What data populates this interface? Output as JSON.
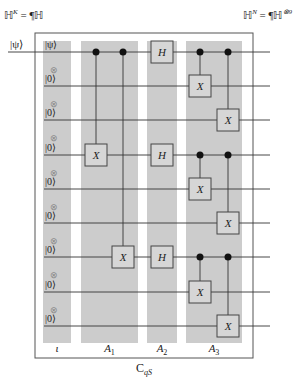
{
  "header": {
    "left": {
      "base": "ℍ",
      "sup": "K",
      "rhs": "= ¶ℍ"
    },
    "right": {
      "base": "ℍ",
      "sup": "N",
      "rhs": "= ¶ℍ",
      "rhs_sup": "⊗9"
    }
  },
  "input_label": "|ψ⟩",
  "register": {
    "labels": [
      "|ψ⟩",
      "|0⟩",
      "|0⟩",
      "|0⟩",
      "|0⟩",
      "|0⟩",
      "|0⟩",
      "|0⟩",
      "|0⟩"
    ],
    "tensor_symbol": "⊗"
  },
  "wires_y": [
    52,
    86,
    120,
    155,
    189,
    223,
    257,
    292,
    326
  ],
  "columns": [
    {
      "name": "iota",
      "label": "ι",
      "x0": 43,
      "x1": 71
    },
    {
      "name": "A1",
      "label": "A",
      "sub": "1",
      "x0": 81,
      "x1": 138
    },
    {
      "name": "A2",
      "label": "A",
      "sub": "2",
      "x0": 147,
      "x1": 177
    },
    {
      "name": "A3",
      "label": "A",
      "sub": "3",
      "x0": 186,
      "x1": 242
    }
  ],
  "gates": [
    {
      "type": "cnot",
      "x": 96,
      "control": 0,
      "target": 3
    },
    {
      "type": "cnot",
      "x": 123,
      "control": 0,
      "target": 6
    },
    {
      "type": "box",
      "label": "H",
      "x": 162,
      "wire": 0
    },
    {
      "type": "box",
      "label": "H",
      "x": 162,
      "wire": 3
    },
    {
      "type": "box",
      "label": "H",
      "x": 162,
      "wire": 6
    },
    {
      "type": "cnot",
      "x": 200,
      "control": 0,
      "target": 1
    },
    {
      "type": "cnot",
      "x": 228,
      "control": 0,
      "target": 2
    },
    {
      "type": "cnot",
      "x": 200,
      "control": 3,
      "target": 4
    },
    {
      "type": "cnot",
      "x": 228,
      "control": 3,
      "target": 5
    },
    {
      "type": "cnot",
      "x": 200,
      "control": 6,
      "target": 7
    },
    {
      "type": "cnot",
      "x": 228,
      "control": 6,
      "target": 8
    }
  ],
  "target_label": "X",
  "frame": {
    "x0": 35,
    "y0": 33,
    "x1": 253,
    "y1": 358
  },
  "caption": {
    "base": "C",
    "sub": "qS"
  },
  "colors": {
    "column_fill": "#cccccc",
    "gate_fill": "#d6d6d6",
    "line": "#333333",
    "frame": "#555555"
  }
}
